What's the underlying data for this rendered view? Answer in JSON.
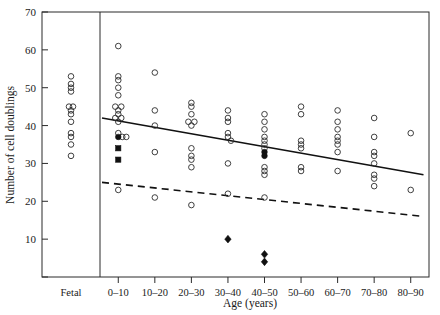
{
  "chart_data": {
    "type": "scatter",
    "title": "",
    "xlabel": "Age (years)",
    "ylabel": "Number of cell doublings",
    "grid": false,
    "legend_position": "none",
    "ylim": [
      0,
      70
    ],
    "yticks": [
      0,
      10,
      20,
      30,
      40,
      50,
      60,
      70
    ],
    "ytick_labels": [
      "",
      "10",
      "20",
      "30",
      "40",
      "50",
      "60",
      "70"
    ],
    "categories": [
      "Fetal",
      "0–10",
      "10–20",
      "20–30",
      "30–40",
      "40–50",
      "50–60",
      "60–70",
      "70–80",
      "80–90"
    ],
    "series": [
      {
        "name": "open-circles",
        "marker": "open-circle",
        "points": [
          {
            "category": "Fetal",
            "x_offset": 0,
            "y": 53
          },
          {
            "category": "Fetal",
            "x_offset": 0,
            "y": 51
          },
          {
            "category": "Fetal",
            "x_offset": 0,
            "y": 50
          },
          {
            "category": "Fetal",
            "x_offset": 0,
            "y": 49
          },
          {
            "category": "Fetal",
            "x_offset": -2,
            "y": 45
          },
          {
            "category": "Fetal",
            "x_offset": 2,
            "y": 45
          },
          {
            "category": "Fetal",
            "x_offset": 0,
            "y": 44
          },
          {
            "category": "Fetal",
            "x_offset": 0,
            "y": 43
          },
          {
            "category": "Fetal",
            "x_offset": 0,
            "y": 41
          },
          {
            "category": "Fetal",
            "x_offset": 0,
            "y": 38
          },
          {
            "category": "Fetal",
            "x_offset": 0,
            "y": 37
          },
          {
            "category": "Fetal",
            "x_offset": 0,
            "y": 35
          },
          {
            "category": "Fetal",
            "x_offset": 0,
            "y": 32
          },
          {
            "category": "0–10",
            "x_offset": 0,
            "y": 61
          },
          {
            "category": "0–10",
            "x_offset": 0,
            "y": 53
          },
          {
            "category": "0–10",
            "x_offset": 0,
            "y": 52
          },
          {
            "category": "0–10",
            "x_offset": 0,
            "y": 50
          },
          {
            "category": "0–10",
            "x_offset": 0,
            "y": 48
          },
          {
            "category": "0–10",
            "x_offset": -3,
            "y": 45
          },
          {
            "category": "0–10",
            "x_offset": 3,
            "y": 45
          },
          {
            "category": "0–10",
            "x_offset": 0,
            "y": 44
          },
          {
            "category": "0–10",
            "x_offset": 0,
            "y": 43
          },
          {
            "category": "0–10",
            "x_offset": -3,
            "y": 42
          },
          {
            "category": "0–10",
            "x_offset": 3,
            "y": 42
          },
          {
            "category": "0–10",
            "x_offset": 0,
            "y": 41
          },
          {
            "category": "0–10",
            "x_offset": 0,
            "y": 38
          },
          {
            "category": "0–10",
            "x_offset": 4,
            "y": 37
          },
          {
            "category": "0–10",
            "x_offset": 8,
            "y": 37
          },
          {
            "category": "0–10",
            "x_offset": 0,
            "y": 23
          },
          {
            "category": "10–20",
            "x_offset": 0,
            "y": 54
          },
          {
            "category": "10–20",
            "x_offset": 0,
            "y": 44
          },
          {
            "category": "10–20",
            "x_offset": 0,
            "y": 40
          },
          {
            "category": "10–20",
            "x_offset": 0,
            "y": 33
          },
          {
            "category": "10–20",
            "x_offset": 0,
            "y": 21
          },
          {
            "category": "20–30",
            "x_offset": 0,
            "y": 46
          },
          {
            "category": "20–30",
            "x_offset": 0,
            "y": 45
          },
          {
            "category": "20–30",
            "x_offset": 0,
            "y": 43
          },
          {
            "category": "20–30",
            "x_offset": -3,
            "y": 41
          },
          {
            "category": "20–30",
            "x_offset": 3,
            "y": 41
          },
          {
            "category": "20–30",
            "x_offset": 0,
            "y": 40
          },
          {
            "category": "20–30",
            "x_offset": 0,
            "y": 34
          },
          {
            "category": "20–30",
            "x_offset": 0,
            "y": 32
          },
          {
            "category": "20–30",
            "x_offset": 0,
            "y": 31
          },
          {
            "category": "20–30",
            "x_offset": 0,
            "y": 29
          },
          {
            "category": "20–30",
            "x_offset": 0,
            "y": 19
          },
          {
            "category": "30–40",
            "x_offset": 0,
            "y": 44
          },
          {
            "category": "30–40",
            "x_offset": 0,
            "y": 42
          },
          {
            "category": "30–40",
            "x_offset": 0,
            "y": 41
          },
          {
            "category": "30–40",
            "x_offset": 0,
            "y": 38
          },
          {
            "category": "30–40",
            "x_offset": 0,
            "y": 37
          },
          {
            "category": "30–40",
            "x_offset": 3,
            "y": 36
          },
          {
            "category": "30–40",
            "x_offset": 0,
            "y": 30
          },
          {
            "category": "30–40",
            "x_offset": 0,
            "y": 22
          },
          {
            "category": "40–50",
            "x_offset": 0,
            "y": 43
          },
          {
            "category": "40–50",
            "x_offset": 0,
            "y": 41
          },
          {
            "category": "40–50",
            "x_offset": 0,
            "y": 39
          },
          {
            "category": "40–50",
            "x_offset": 0,
            "y": 37
          },
          {
            "category": "40–50",
            "x_offset": 0,
            "y": 36
          },
          {
            "category": "40–50",
            "x_offset": 0,
            "y": 35
          },
          {
            "category": "40–50",
            "x_offset": 0,
            "y": 34
          },
          {
            "category": "40–50",
            "x_offset": 0,
            "y": 29
          },
          {
            "category": "40–50",
            "x_offset": 0,
            "y": 28
          },
          {
            "category": "40–50",
            "x_offset": 0,
            "y": 27
          },
          {
            "category": "40–50",
            "x_offset": 0,
            "y": 21
          },
          {
            "category": "50–60",
            "x_offset": 0,
            "y": 45
          },
          {
            "category": "50–60",
            "x_offset": 0,
            "y": 43
          },
          {
            "category": "50–60",
            "x_offset": 0,
            "y": 36
          },
          {
            "category": "50–60",
            "x_offset": 0,
            "y": 35
          },
          {
            "category": "50–60",
            "x_offset": 0,
            "y": 34
          },
          {
            "category": "50–60",
            "x_offset": 0,
            "y": 29
          },
          {
            "category": "50–60",
            "x_offset": 0,
            "y": 28
          },
          {
            "category": "60–70",
            "x_offset": 0,
            "y": 44
          },
          {
            "category": "60–70",
            "x_offset": 0,
            "y": 41
          },
          {
            "category": "60–70",
            "x_offset": 0,
            "y": 39
          },
          {
            "category": "60–70",
            "x_offset": 0,
            "y": 37
          },
          {
            "category": "60–70",
            "x_offset": 0,
            "y": 36
          },
          {
            "category": "60–70",
            "x_offset": 0,
            "y": 35
          },
          {
            "category": "60–70",
            "x_offset": 0,
            "y": 33
          },
          {
            "category": "60–70",
            "x_offset": 0,
            "y": 28
          },
          {
            "category": "70–80",
            "x_offset": 0,
            "y": 42
          },
          {
            "category": "70–80",
            "x_offset": 0,
            "y": 37
          },
          {
            "category": "70–80",
            "x_offset": 0,
            "y": 33
          },
          {
            "category": "70–80",
            "x_offset": 0,
            "y": 32
          },
          {
            "category": "70–80",
            "x_offset": 0,
            "y": 30
          },
          {
            "category": "70–80",
            "x_offset": 0,
            "y": 27
          },
          {
            "category": "70–80",
            "x_offset": 0,
            "y": 26
          },
          {
            "category": "70–80",
            "x_offset": 0,
            "y": 24
          },
          {
            "category": "80–90",
            "x_offset": 0,
            "y": 38
          },
          {
            "category": "80–90",
            "x_offset": 0,
            "y": 23
          }
        ]
      },
      {
        "name": "filled-circles",
        "marker": "filled-circle",
        "points": [
          {
            "category": "0–10",
            "x_offset": 0,
            "y": 37
          },
          {
            "category": "40–50",
            "x_offset": 0,
            "y": 33
          },
          {
            "category": "40–50",
            "x_offset": 0,
            "y": 32
          }
        ]
      },
      {
        "name": "filled-squares",
        "marker": "filled-square",
        "points": [
          {
            "category": "0–10",
            "x_offset": 0,
            "y": 34
          },
          {
            "category": "0–10",
            "x_offset": 0,
            "y": 31
          }
        ]
      },
      {
        "name": "filled-diamonds",
        "marker": "filled-diamond",
        "points": [
          {
            "category": "30–40",
            "x_offset": 0,
            "y": 10
          },
          {
            "category": "40–50",
            "x_offset": 0,
            "y": 6
          },
          {
            "category": "40–50",
            "x_offset": 0,
            "y": 4
          }
        ]
      }
    ],
    "fit_lines": [
      {
        "name": "regression-solid",
        "style": "solid",
        "x_start_category": "0–10",
        "x_end_category": "80–90",
        "y_start": 42,
        "y_end": 27
      },
      {
        "name": "regression-dashed",
        "style": "dashed",
        "x_start_category": "0–10",
        "x_end_category": "80–90",
        "y_start": 25,
        "y_end": 16
      }
    ]
  }
}
